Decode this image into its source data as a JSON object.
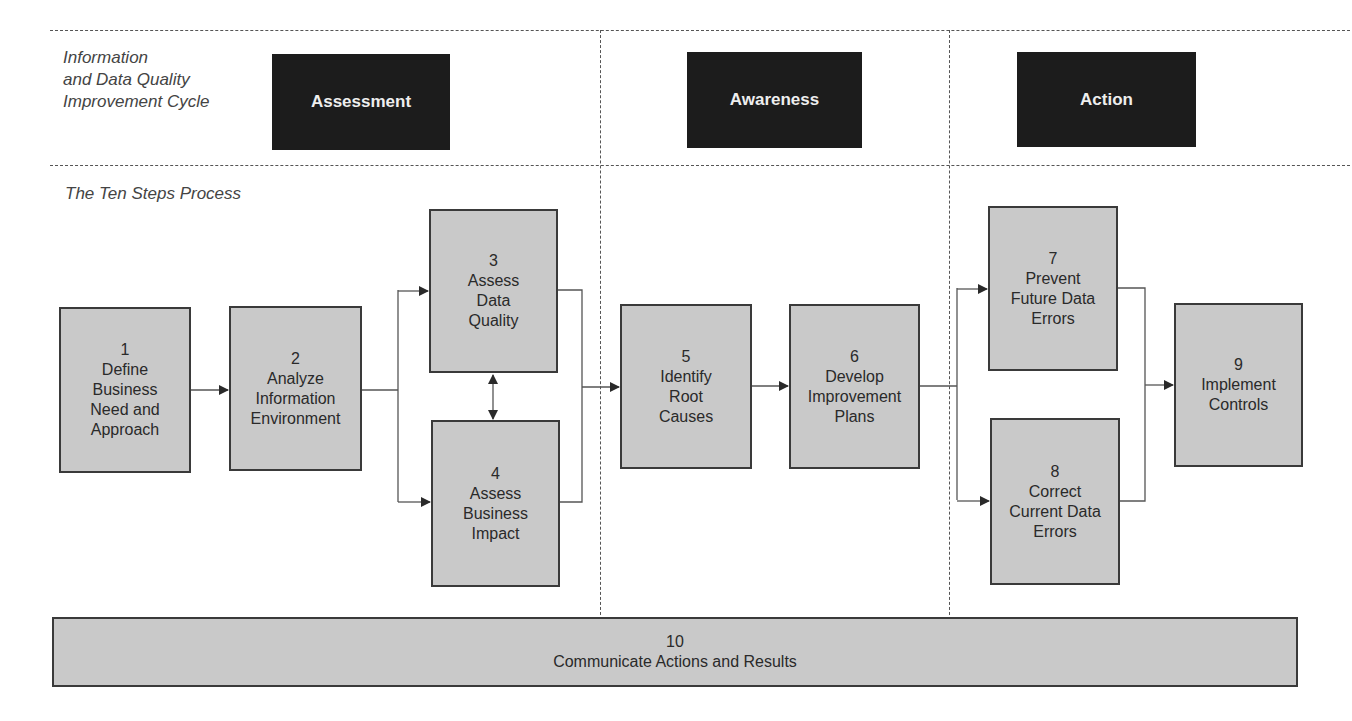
{
  "header": {
    "cycle_label": "Information\nand Data Quality\nImprovement Cycle",
    "process_label": "The Ten Steps Process"
  },
  "phases": [
    {
      "label": "Assessment"
    },
    {
      "label": "Awareness"
    },
    {
      "label": "Action"
    }
  ],
  "steps": [
    {
      "number": "1",
      "title": "Define\nBusiness\nNeed and\nApproach"
    },
    {
      "number": "2",
      "title": "Analyze\nInformation\nEnvironment"
    },
    {
      "number": "3",
      "title": "Assess\nData\nQuality"
    },
    {
      "number": "4",
      "title": "Assess\nBusiness\nImpact"
    },
    {
      "number": "5",
      "title": "Identify\nRoot\nCauses"
    },
    {
      "number": "6",
      "title": "Develop\nImprovement\nPlans"
    },
    {
      "number": "7",
      "title": "Prevent\nFuture Data\nErrors"
    },
    {
      "number": "8",
      "title": "Correct\nCurrent Data\nErrors"
    },
    {
      "number": "9",
      "title": "Implement\nControls"
    },
    {
      "number": "10",
      "title": "Communicate Actions and Results"
    }
  ],
  "colors": {
    "phase_bg": "#1c1c1c",
    "step_bg": "#c9c9c9",
    "border": "#3a3a3a"
  }
}
